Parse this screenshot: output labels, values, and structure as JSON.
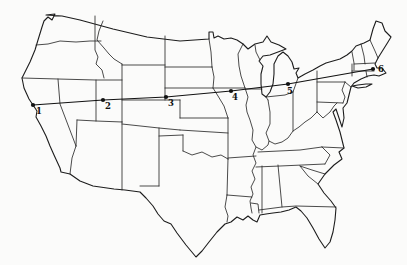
{
  "figure": {
    "kind": "outline-map-with-route",
    "region": "contiguous United States state outline map",
    "background_color": "#fbfbfa",
    "line_color": "#1c1c1c"
  },
  "route": {
    "description": "straight cross-country route line through six numbered stops, west coast to northeast coast",
    "stroke_color": "#111111",
    "points": [
      {
        "label": "1",
        "x": 33,
        "y": 105,
        "label_dx": 3,
        "label_dy": 9
      },
      {
        "label": "2",
        "x": 103,
        "y": 100,
        "label_dx": 2,
        "label_dy": 9
      },
      {
        "label": "3",
        "x": 166,
        "y": 97,
        "label_dx": 2,
        "label_dy": 9
      },
      {
        "label": "4",
        "x": 231,
        "y": 91,
        "label_dx": 1,
        "label_dy": 9
      },
      {
        "label": "5",
        "x": 288,
        "y": 84,
        "label_dx": -1,
        "label_dy": 10
      },
      {
        "label": "6",
        "x": 373,
        "y": 69,
        "label_dx": 5,
        "label_dy": 3
      }
    ]
  }
}
